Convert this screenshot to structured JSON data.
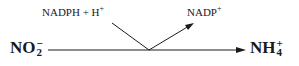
{
  "diagram": {
    "reactant": {
      "base": "NO",
      "sub": "2",
      "sup": "−"
    },
    "product": {
      "base": "NH",
      "sub": "4",
      "sup": "+"
    },
    "cofactor_in": {
      "text": "NADPH + H",
      "sup": "+"
    },
    "cofactor_out": {
      "text": "NADP",
      "sup": "+"
    }
  }
}
